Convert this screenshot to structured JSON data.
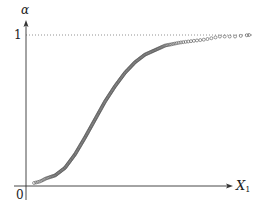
{
  "chart_data": {
    "type": "scatter",
    "title": "",
    "xlabel": "X",
    "xlabel_subscript": "1",
    "ylabel": "α",
    "x_tick_labels": [
      "0"
    ],
    "y_tick_labels": [
      "1"
    ],
    "reference_lines": [
      {
        "axis": "y",
        "value": 1,
        "style": "dotted"
      }
    ],
    "ylim": [
      0,
      1
    ],
    "xlim": [
      0,
      1
    ],
    "grid": false,
    "legend": null,
    "marker": "open-circle",
    "series": [
      {
        "name": "α(X1)",
        "x": [
          0.036,
          0.063,
          0.089,
          0.13,
          0.174,
          0.219,
          0.263,
          0.308,
          0.353,
          0.397,
          0.442,
          0.487,
          0.531,
          0.576,
          0.621,
          0.688,
          0.741,
          0.799,
          0.866,
          0.933,
          0.996
        ],
        "y": [
          0.02,
          0.03,
          0.05,
          0.07,
          0.12,
          0.21,
          0.32,
          0.44,
          0.56,
          0.66,
          0.75,
          0.82,
          0.87,
          0.9,
          0.93,
          0.95,
          0.96,
          0.97,
          0.99,
          0.99,
          1.0
        ]
      }
    ]
  },
  "labels": {
    "y_axis": "α",
    "y_one": "1",
    "origin": "0",
    "x_axis_main": "X",
    "x_axis_sub": "1"
  },
  "colors": {
    "axis": "#333333",
    "points": "#555555",
    "reference_line": "#777777"
  }
}
